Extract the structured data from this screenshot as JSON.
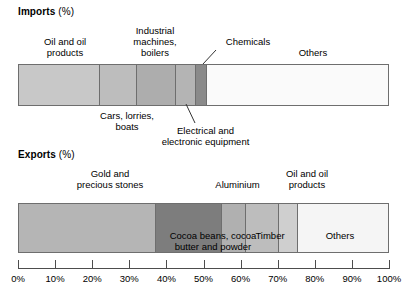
{
  "imports": {
    "title": "Imports",
    "unit": "(%)",
    "labels": {
      "oil": "Oil and oil\nproducts",
      "cars": "Cars, lorries,\nboats",
      "industrial": "Industrial\nmachines,\nboilers",
      "electrical": "Electrical and\nelectronic equipment",
      "chemicals": "Chemicals",
      "others": "Others"
    }
  },
  "exports": {
    "title": "Exports",
    "unit": "(%)",
    "labels": {
      "gold": "Gold and\nprecious stones",
      "cocoa": "Cocoa beans, cocoa\nbutter and powder",
      "aluminium": "Aluminium",
      "timber": "Timber",
      "oil": "Oil and oil\nproducts",
      "others": "Others"
    }
  },
  "axis": {
    "ticks": [
      "0%",
      "10%",
      "20%",
      "30%",
      "40%",
      "50%",
      "60%",
      "70%",
      "80%",
      "90%",
      "100%"
    ],
    "min": 0,
    "max": 100
  },
  "chart_data": {
    "type": "bar",
    "subtype": "stacked-horizontal-100-percent",
    "title": "",
    "xlabel": "",
    "ylabel": "",
    "xlim": [
      0,
      100
    ],
    "grid": false,
    "legend": "inline-labels",
    "categories": [
      "Imports (%)",
      "Exports (%)"
    ],
    "charts": [
      {
        "name": "Imports (%)",
        "segments": [
          {
            "label": "Oil and oil products",
            "value": 22.0,
            "start": 0.0,
            "end": 22.0,
            "color": "#c8c8c8"
          },
          {
            "label": "Cars, lorries, boats",
            "value": 10.0,
            "start": 22.0,
            "end": 32.0,
            "color": "#bdbdbd"
          },
          {
            "label": "Industrial machines, boilers",
            "value": 10.5,
            "start": 32.0,
            "end": 42.5,
            "color": "#adadad"
          },
          {
            "label": "Electrical and electronic equipment",
            "value": 5.5,
            "start": 42.5,
            "end": 48.0,
            "color": "#b4b4b4"
          },
          {
            "label": "Chemicals",
            "value": 3.0,
            "start": 48.0,
            "end": 51.0,
            "color": "#8a8a8a"
          },
          {
            "label": "Others",
            "value": 49.0,
            "start": 51.0,
            "end": 100.0,
            "color": "#fafafa"
          }
        ]
      },
      {
        "name": "Exports (%)",
        "segments": [
          {
            "label": "Gold and precious stones",
            "value": 37.0,
            "start": 0.0,
            "end": 37.0,
            "color": "#b5b5b5"
          },
          {
            "label": "Cocoa beans, cocoa butter and powder",
            "value": 18.0,
            "start": 37.0,
            "end": 55.0,
            "color": "#7d7d7d"
          },
          {
            "label": "Aluminium",
            "value": 6.5,
            "start": 55.0,
            "end": 61.5,
            "color": "#b0b0b0"
          },
          {
            "label": "Timber",
            "value": 9.0,
            "start": 61.5,
            "end": 70.5,
            "color": "#bdbdbd"
          },
          {
            "label": "Oil and oil products",
            "value": 5.0,
            "start": 70.5,
            "end": 75.5,
            "color": "#cfcfcf"
          },
          {
            "label": "Others",
            "value": 24.5,
            "start": 75.5,
            "end": 100.0,
            "color": "#f5f5f5"
          }
        ]
      }
    ]
  },
  "colors": {
    "outline": "#6e6e6e",
    "axis": "#4d4d4d",
    "text": "#000000"
  }
}
